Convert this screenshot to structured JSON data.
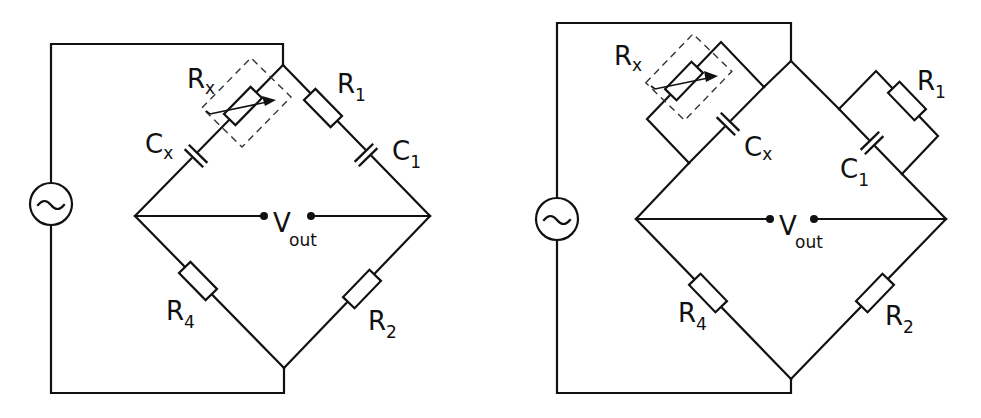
{
  "figure": {
    "panels": [
      {
        "id": "series-bridge",
        "source_symbol": "~",
        "labels": {
          "rx": {
            "main": "R",
            "sub": "x"
          },
          "cx": {
            "main": "C",
            "sub": "x"
          },
          "r1": {
            "main": "R",
            "sub": "1"
          },
          "c1": {
            "main": "C",
            "sub": "1"
          },
          "r4": {
            "main": "R",
            "sub": "4"
          },
          "r2": {
            "main": "R",
            "sub": "2"
          },
          "vout": {
            "main": "V",
            "sub": "out"
          }
        }
      },
      {
        "id": "parallel-bridge",
        "source_symbol": "~",
        "labels": {
          "rx": {
            "main": "R",
            "sub": "x"
          },
          "cx": {
            "main": "C",
            "sub": "x"
          },
          "r1": {
            "main": "R",
            "sub": "1"
          },
          "c1": {
            "main": "C",
            "sub": "1"
          },
          "r4": {
            "main": "R",
            "sub": "4"
          },
          "r2": {
            "main": "R",
            "sub": "2"
          },
          "vout": {
            "main": "V",
            "sub": "out"
          }
        }
      }
    ]
  }
}
